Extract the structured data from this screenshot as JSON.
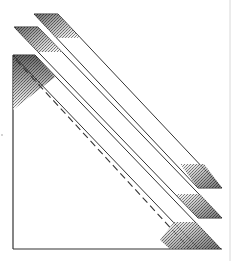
{
  "figure": {
    "colors": {
      "background": "#ffffff",
      "line": "#333333",
      "shade": "#555555",
      "border": "#d8d8d8"
    },
    "square": {
      "left": 13,
      "top": 55,
      "right": 221,
      "bottom": 249
    },
    "bands": [
      {
        "name": "top-band",
        "top_left": [
          34,
          14
        ],
        "top_right": [
          58,
          14
        ],
        "bottom_left": [
          198,
          188
        ],
        "bottom_right": [
          222,
          188
        ]
      },
      {
        "name": "middle-band",
        "top_left": [
          14,
          27
        ],
        "top_right": [
          38,
          27
        ],
        "bottom_left": [
          198,
          218
        ],
        "bottom_right": [
          222,
          218
        ]
      },
      {
        "name": "bottom-band",
        "top_left": [
          13,
          55
        ],
        "top_right": [
          35,
          55
        ],
        "bottom_left": [
          199,
          249
        ],
        "bottom_right": [
          221,
          249
        ]
      }
    ],
    "dashed_diagonal": {
      "from": [
        16,
        60
      ],
      "to": [
        190,
        249
      ]
    }
  }
}
